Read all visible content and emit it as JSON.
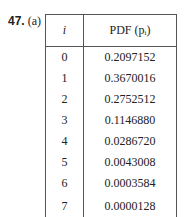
{
  "problem": {
    "number": "47.",
    "part": "(a)"
  },
  "table": {
    "headers": {
      "i": "i",
      "pdf": "PDF (pᵢ)"
    },
    "rows": [
      {
        "i": "0",
        "p": "0.2097152"
      },
      {
        "i": "1",
        "p": "0.3670016"
      },
      {
        "i": "2",
        "p": "0.2752512"
      },
      {
        "i": "3",
        "p": "0.1146880"
      },
      {
        "i": "4",
        "p": "0.0286720"
      },
      {
        "i": "5",
        "p": "0.0043008"
      },
      {
        "i": "6",
        "p": "0.0003584"
      },
      {
        "i": "7",
        "p": "0.0000128"
      }
    ]
  }
}
